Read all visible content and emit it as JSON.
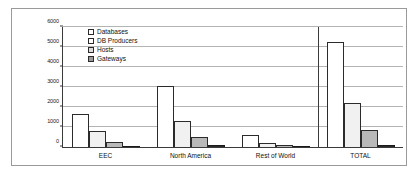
{
  "chart_data": {
    "type": "bar",
    "title": "",
    "subtitle": "",
    "xlabel": "",
    "ylabel": "",
    "ylim": [
      0,
      6000
    ],
    "yticks": [
      0,
      1000,
      2000,
      3000,
      4000,
      5000,
      6000
    ],
    "ytick_labels": [
      "0",
      "1000",
      "2000",
      "3000",
      "4000",
      "5000",
      "6000"
    ],
    "grid": true,
    "legend_position": "upper-left-inside",
    "categories": [
      "EEC",
      "North America",
      "Rest of World",
      "TOTAL"
    ],
    "series": [
      {
        "name": "Databases",
        "color": "#ffffff",
        "values": [
          1650,
          3050,
          620,
          5250
        ]
      },
      {
        "name": "DB Producers",
        "color": "#f1f1f1",
        "values": [
          800,
          1300,
          220,
          2200
        ]
      },
      {
        "name": "Hosts",
        "color": "#b9b9b9",
        "values": [
          270,
          490,
          100,
          850
        ]
      },
      {
        "name": "Gateways",
        "color": "#2b2b2b",
        "values": [
          50,
          80,
          30,
          100
        ]
      }
    ],
    "separator_after_category": "Rest of World"
  },
  "legend": {
    "items": [
      {
        "label": "Databases"
      },
      {
        "label": "DB Producers"
      },
      {
        "label": "Hosts"
      },
      {
        "label": "Gateways"
      }
    ]
  }
}
